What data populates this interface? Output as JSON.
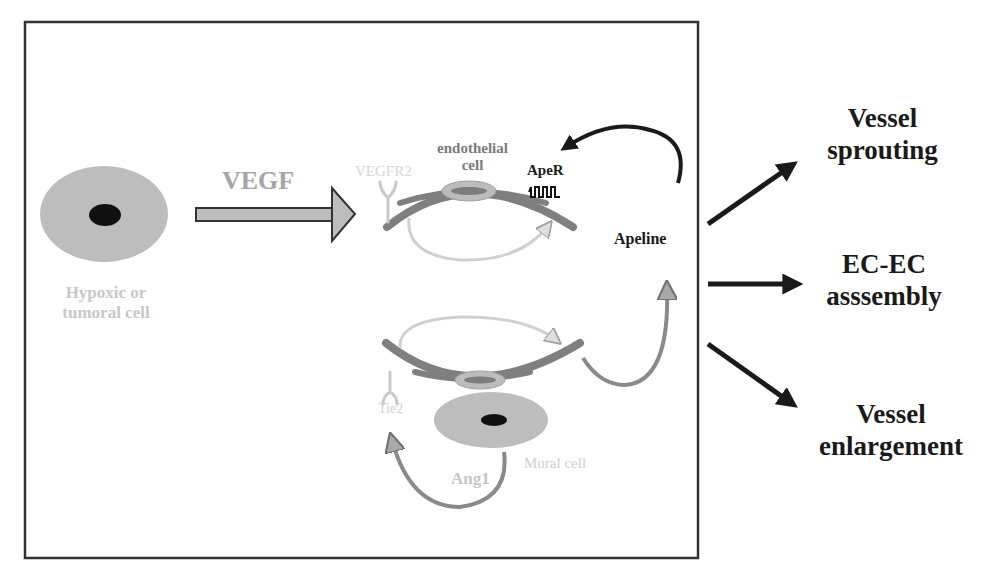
{
  "figure": {
    "frame": {
      "stroke": "#333333"
    },
    "colors": {
      "cell_fill": "#bdbdbd",
      "nucleus": "#111111",
      "vessel_wall": "#7f7f7f",
      "vessel_nucleus_outer": "#b5b5b5",
      "vessel_nucleus_inner": "#8a8a8a",
      "receptor_faint": "#c9c9c9",
      "arrow_dark": "#1a1a1a",
      "arrow_gray_fill": "#b9b9b9",
      "arrow_light": "#d2d2d2"
    }
  },
  "labels": {
    "source_cell": {
      "line1": "Hypoxic or",
      "line2": "tumoral cell"
    },
    "vegf": "VEGF",
    "vegfr2": "VEGFR2",
    "endothelial": {
      "line1": "endothelial",
      "line2": "cell"
    },
    "aper": "ApeR",
    "apeline": "Apeline",
    "tie2": "Tie2",
    "mural_cell": "Mural cell",
    "ang1": "Ang1"
  },
  "outcomes": [
    {
      "line1": "Vessel",
      "line2": "sprouting"
    },
    {
      "line1": "EC-EC",
      "line2": "asssembly"
    },
    {
      "line1": "Vessel",
      "line2": "enlargement"
    }
  ]
}
